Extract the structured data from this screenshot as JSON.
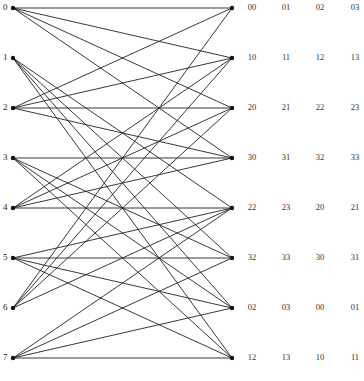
{
  "diagram": {
    "type": "bipartite-graph",
    "left_nodes": [
      {
        "label": "0",
        "y": 8
      },
      {
        "label": "1",
        "y": 58
      },
      {
        "label": "2",
        "y": 108
      },
      {
        "label": "3",
        "y": 158
      },
      {
        "label": "4",
        "y": 208
      },
      {
        "label": "5",
        "y": 258
      },
      {
        "label": "6",
        "y": 308
      },
      {
        "label": "7",
        "y": 358
      }
    ],
    "right_nodes": [
      {
        "y": 8,
        "labels": [
          "00",
          "01",
          "02",
          "03"
        ]
      },
      {
        "y": 58,
        "labels": [
          "10",
          "11",
          "12",
          "13"
        ]
      },
      {
        "y": 108,
        "labels": [
          "20",
          "21",
          "22",
          "23"
        ]
      },
      {
        "y": 158,
        "labels": [
          "30",
          "31",
          "32",
          "33"
        ]
      },
      {
        "y": 208,
        "labels": [
          "22",
          "23",
          "20",
          "21"
        ]
      },
      {
        "y": 258,
        "labels": [
          "32",
          "33",
          "30",
          "31"
        ]
      },
      {
        "y": 308,
        "labels": [
          "02",
          "03",
          "00",
          "01"
        ]
      },
      {
        "y": 358,
        "labels": [
          "12",
          "13",
          "10",
          "11"
        ]
      }
    ],
    "edges": [
      [
        0,
        0
      ],
      [
        0,
        1
      ],
      [
        0,
        2
      ],
      [
        0,
        3
      ],
      [
        1,
        4
      ],
      [
        1,
        5
      ],
      [
        1,
        6
      ],
      [
        1,
        7
      ],
      [
        2,
        0
      ],
      [
        2,
        1
      ],
      [
        2,
        2
      ],
      [
        2,
        3
      ],
      [
        3,
        3
      ],
      [
        3,
        5
      ],
      [
        3,
        6
      ],
      [
        3,
        7
      ],
      [
        4,
        1
      ],
      [
        4,
        2
      ],
      [
        4,
        3
      ],
      [
        4,
        4
      ],
      [
        5,
        4
      ],
      [
        5,
        5
      ],
      [
        5,
        6
      ],
      [
        5,
        7
      ],
      [
        6,
        0
      ],
      [
        6,
        1
      ],
      [
        6,
        2
      ],
      [
        6,
        4
      ],
      [
        7,
        4
      ],
      [
        7,
        5
      ],
      [
        7,
        6
      ],
      [
        7,
        7
      ]
    ],
    "colors": {
      "line": "#222222",
      "node": "#111111",
      "background": "#ffffff"
    }
  }
}
